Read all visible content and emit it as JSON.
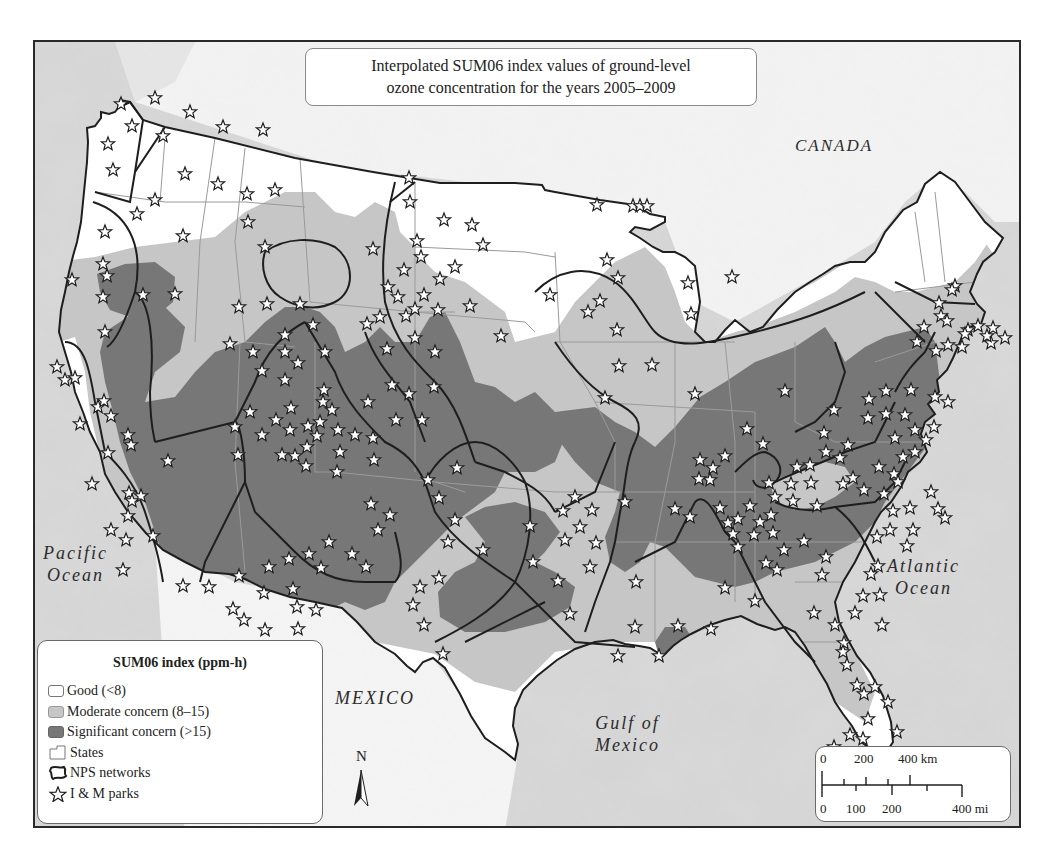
{
  "title": {
    "line1": "Interpolated SUM06 index values of ground-level",
    "line2": "ozone concentration for the years 2005–2009"
  },
  "labels": {
    "canada": "CANADA",
    "mexico": "MEXICO",
    "pacific_line1": "Pacific",
    "pacific_line2": "Ocean",
    "atlantic_line1": "Atlantic",
    "atlantic_line2": "Ocean",
    "gulf_line1": "Gulf of",
    "gulf_line2": "Mexico"
  },
  "legend": {
    "title": "SUM06 index (ppm-h)",
    "items": [
      {
        "label": "Good (<8)",
        "icon": "swatch-white"
      },
      {
        "label": "Moderate concern (8–15)",
        "icon": "swatch-light-gray"
      },
      {
        "label": "Significant concern (>15)",
        "icon": "swatch-dark-gray"
      },
      {
        "label": "States",
        "icon": "state-outline-icon"
      },
      {
        "label": "NPS networks",
        "icon": "network-outline-icon"
      },
      {
        "label": "I & M parks",
        "icon": "star-icon"
      }
    ]
  },
  "north_arrow": {
    "label": "N"
  },
  "scale_bar": {
    "km_labels": [
      "0",
      "200",
      "400 km"
    ],
    "mi_labels": [
      "0",
      "100",
      "200",
      "400 mi"
    ]
  },
  "colors": {
    "background": "#d2d2d2",
    "good": "#ffffff",
    "moderate": "#c6c6c6",
    "significant": "#777777",
    "boundary": "#1e1e1e"
  },
  "parks": [
    [
      86,
      62
    ],
    [
      97,
      84
    ],
    [
      120,
      56
    ],
    [
      73,
      102
    ],
    [
      128,
      94
    ],
    [
      155,
      70
    ],
    [
      188,
      85
    ],
    [
      228,
      88
    ],
    [
      78,
      128
    ],
    [
      150,
      132
    ],
    [
      120,
      158
    ],
    [
      183,
      142
    ],
    [
      212,
      152
    ],
    [
      240,
      148
    ],
    [
      213,
      180
    ],
    [
      230,
      205
    ],
    [
      102,
      172
    ],
    [
      70,
      190
    ],
    [
      68,
      222
    ],
    [
      37,
      238
    ],
    [
      72,
      234
    ],
    [
      68,
      255
    ],
    [
      70,
      290
    ],
    [
      140,
      252
    ],
    [
      108,
      253
    ],
    [
      148,
      194
    ],
    [
      204,
      265
    ],
    [
      232,
      262
    ],
    [
      195,
      302
    ],
    [
      218,
      310
    ],
    [
      227,
      329
    ],
    [
      215,
      370
    ],
    [
      250,
      310
    ],
    [
      250,
      293
    ],
    [
      263,
      321
    ],
    [
      250,
      338
    ],
    [
      256,
      366
    ],
    [
      241,
      378
    ],
    [
      255,
      388
    ],
    [
      273,
      384
    ],
    [
      289,
      348
    ],
    [
      297,
      368
    ],
    [
      247,
      413
    ],
    [
      200,
      385
    ],
    [
      227,
      393
    ],
    [
      203,
      413
    ],
    [
      260,
      414
    ],
    [
      272,
      405
    ],
    [
      282,
      394
    ],
    [
      271,
      424
    ],
    [
      305,
      410
    ],
    [
      303,
      388
    ],
    [
      302,
      430
    ],
    [
      320,
      393
    ],
    [
      338,
      396
    ],
    [
      339,
      418
    ],
    [
      333,
      360
    ],
    [
      357,
      343
    ],
    [
      361,
      378
    ],
    [
      387,
      378
    ],
    [
      352,
      307
    ],
    [
      332,
      282
    ],
    [
      278,
      283
    ],
    [
      288,
      360
    ],
    [
      285,
      380
    ],
    [
      265,
      262
    ],
    [
      290,
      310
    ],
    [
      345,
      275
    ],
    [
      400,
      310
    ],
    [
      399,
      345
    ],
    [
      393,
      438
    ],
    [
      422,
      426
    ],
    [
      404,
      456
    ],
    [
      420,
      478
    ],
    [
      413,
      500
    ],
    [
      448,
      508
    ],
    [
      404,
      536
    ],
    [
      385,
      545
    ],
    [
      378,
      563
    ],
    [
      389,
      583
    ],
    [
      408,
      612
    ],
    [
      336,
      462
    ],
    [
      355,
      473
    ],
    [
      343,
      488
    ],
    [
      294,
      500
    ],
    [
      317,
      512
    ],
    [
      331,
      525
    ],
    [
      274,
      512
    ],
    [
      258,
      547
    ],
    [
      262,
      565
    ],
    [
      281,
      568
    ],
    [
      263,
      587
    ],
    [
      229,
      551
    ],
    [
      204,
      534
    ],
    [
      198,
      567
    ],
    [
      174,
      545
    ],
    [
      209,
      578
    ],
    [
      230,
      588
    ],
    [
      234,
      525
    ],
    [
      254,
      517
    ],
    [
      286,
      526
    ],
    [
      148,
      544
    ],
    [
      88,
      528
    ],
    [
      94,
      451
    ],
    [
      93,
      474
    ],
    [
      76,
      488
    ],
    [
      118,
      494
    ],
    [
      96,
      403
    ],
    [
      133,
      419
    ],
    [
      106,
      454
    ],
    [
      97,
      459
    ],
    [
      93,
      393
    ],
    [
      73,
      411
    ],
    [
      22,
      325
    ],
    [
      30,
      338
    ],
    [
      40,
      336
    ],
    [
      45,
      382
    ],
    [
      63,
      365
    ],
    [
      69,
      359
    ],
    [
      76,
      374
    ],
    [
      57,
      442
    ],
    [
      91,
      498
    ],
    [
      374,
      136
    ],
    [
      375,
      160
    ],
    [
      382,
      199
    ],
    [
      386,
      215
    ],
    [
      409,
      178
    ],
    [
      448,
      203
    ],
    [
      420,
      225
    ],
    [
      405,
      237
    ],
    [
      435,
      264
    ],
    [
      371,
      274
    ],
    [
      380,
      267
    ],
    [
      380,
      296
    ],
    [
      437,
      183
    ],
    [
      338,
      207
    ],
    [
      353,
      245
    ],
    [
      363,
      255
    ],
    [
      369,
      228
    ],
    [
      389,
      253
    ],
    [
      374,
      352
    ],
    [
      403,
      268
    ],
    [
      466,
      294
    ],
    [
      515,
      253
    ],
    [
      562,
      163
    ],
    [
      598,
      164
    ],
    [
      605,
      164
    ],
    [
      612,
      164
    ],
    [
      572,
      218
    ],
    [
      583,
      236
    ],
    [
      565,
      259
    ],
    [
      553,
      270
    ],
    [
      582,
      288
    ],
    [
      584,
      324
    ],
    [
      570,
      356
    ],
    [
      617,
      323
    ],
    [
      653,
      241
    ],
    [
      656,
      272
    ],
    [
      660,
      352
    ],
    [
      697,
      235
    ],
    [
      750,
      349
    ],
    [
      799,
      368
    ],
    [
      728,
      402
    ],
    [
      789,
      391
    ],
    [
      712,
      387
    ],
    [
      675,
      438
    ],
    [
      693,
      481
    ],
    [
      664,
      437
    ],
    [
      725,
      480
    ],
    [
      703,
      477
    ],
    [
      742,
      528
    ],
    [
      749,
      508
    ],
    [
      715,
      464
    ],
    [
      736,
      473
    ],
    [
      769,
      499
    ],
    [
      791,
      515
    ],
    [
      782,
      464
    ],
    [
      842,
      495
    ],
    [
      858,
      469
    ],
    [
      855,
      488
    ],
    [
      787,
      533
    ],
    [
      731,
      521
    ],
    [
      703,
      505
    ],
    [
      690,
      546
    ],
    [
      720,
      559
    ],
    [
      676,
      587
    ],
    [
      601,
      540
    ],
    [
      600,
      585
    ],
    [
      643,
      584
    ],
    [
      624,
      614
    ],
    [
      583,
      614
    ],
    [
      535,
      572
    ],
    [
      555,
      525
    ],
    [
      498,
      520
    ],
    [
      495,
      484
    ],
    [
      557,
      468
    ],
    [
      540,
      455
    ],
    [
      545,
      485
    ],
    [
      530,
      498
    ],
    [
      561,
      501
    ],
    [
      528,
      469
    ],
    [
      523,
      539
    ],
    [
      590,
      460
    ],
    [
      665,
      418
    ],
    [
      678,
      426
    ],
    [
      690,
      414
    ],
    [
      640,
      467
    ],
    [
      655,
      475
    ],
    [
      685,
      466
    ],
    [
      698,
      492
    ],
    [
      719,
      493
    ],
    [
      738,
      491
    ],
    [
      734,
      441
    ],
    [
      740,
      455
    ],
    [
      756,
      442
    ],
    [
      762,
      425
    ],
    [
      758,
      459
    ],
    [
      775,
      423
    ],
    [
      776,
      441
    ],
    [
      791,
      410
    ],
    [
      805,
      416
    ],
    [
      808,
      442
    ],
    [
      818,
      436
    ],
    [
      829,
      448
    ],
    [
      844,
      425
    ],
    [
      859,
      432
    ],
    [
      868,
      415
    ],
    [
      863,
      440
    ],
    [
      849,
      452
    ],
    [
      875,
      466
    ],
    [
      878,
      488
    ],
    [
      872,
      504
    ],
    [
      880,
      410
    ],
    [
      891,
      398
    ],
    [
      899,
      385
    ],
    [
      880,
      388
    ],
    [
      896,
      450
    ],
    [
      903,
      467
    ],
    [
      910,
      476
    ],
    [
      870,
      373
    ],
    [
      876,
      348
    ],
    [
      900,
      355
    ],
    [
      913,
      360
    ],
    [
      882,
      300
    ],
    [
      901,
      309
    ],
    [
      913,
      303
    ],
    [
      927,
      305
    ],
    [
      943,
      284
    ],
    [
      958,
      286
    ],
    [
      956,
      301
    ],
    [
      933,
      288
    ],
    [
      906,
      274
    ],
    [
      889,
      285
    ],
    [
      904,
      261
    ],
    [
      920,
      244
    ],
    [
      917,
      248
    ],
    [
      912,
      279
    ],
    [
      930,
      292
    ],
    [
      952,
      294
    ],
    [
      970,
      296
    ],
    [
      860,
      396
    ],
    [
      851,
      372
    ],
    [
      833,
      376
    ],
    [
      813,
      403
    ],
    [
      834,
      357
    ],
    [
      851,
      349
    ],
    [
      779,
      571
    ],
    [
      800,
      583
    ],
    [
      809,
      601
    ],
    [
      808,
      610
    ],
    [
      820,
      571
    ],
    [
      828,
      554
    ],
    [
      836,
      532
    ],
    [
      843,
      524
    ],
    [
      845,
      553
    ],
    [
      847,
      583
    ],
    [
      812,
      623
    ],
    [
      822,
      643
    ],
    [
      829,
      652
    ],
    [
      840,
      645
    ],
    [
      853,
      660
    ],
    [
      862,
      690
    ],
    [
      833,
      677
    ],
    [
      828,
      697
    ],
    [
      815,
      693
    ],
    [
      799,
      705
    ],
    [
      805,
      730
    ],
    [
      826,
      743
    ],
    [
      846,
      762
    ],
    [
      820,
      762
    ]
  ]
}
